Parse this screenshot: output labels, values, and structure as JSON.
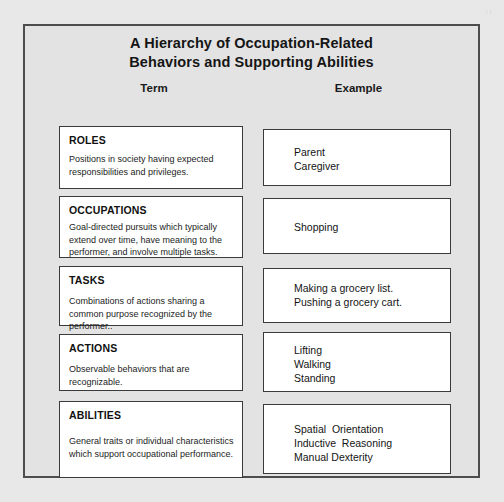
{
  "page": {
    "edge_bleed_text": "| |"
  },
  "figure": {
    "title_line1": "A Hierarchy of Occupation-Related",
    "title_line2": "Behaviors and Supporting Abilities",
    "columns": {
      "term_header": "Term",
      "example_header": "Example"
    },
    "rows": [
      {
        "term_title": "ROLES",
        "term_description": "Positions in society having expected responsibilities and privileges.",
        "example_lines": [
          "Parent",
          "Caregiver"
        ]
      },
      {
        "term_title": "OCCUPATIONS",
        "term_description": "Goal-directed pursuits which typically extend over time, have meaning to the performer, and involve multiple tasks.",
        "example_lines": [
          "Shopping"
        ]
      },
      {
        "term_title": "TASKS",
        "term_description": "Combinations of actions sharing a common purpose recognized by the performer..",
        "example_lines": [
          "Making a grocery list.",
          "Pushing a grocery cart."
        ]
      },
      {
        "term_title": "ACTIONS",
        "term_description": "Observable behaviors that are recognizable.",
        "example_lines": [
          "Lifting",
          "Walking",
          "Standing"
        ]
      },
      {
        "term_title": "ABILITIES",
        "term_description": "General traits or individual characteristics which support occupational performance.",
        "example_lines": [
          "Spatial  Orientation",
          "Inductive  Reasoning",
          "Manual Dexterity"
        ]
      }
    ]
  }
}
